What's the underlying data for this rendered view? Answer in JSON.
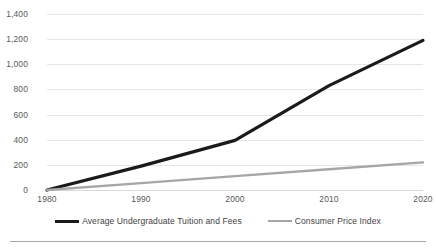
{
  "chart_data": {
    "type": "line",
    "title": "",
    "subtitle": "",
    "xlabel": "",
    "ylabel": "",
    "x": [
      1980,
      1990,
      2000,
      2010,
      2020
    ],
    "categories": [
      "1980",
      "1990",
      "2000",
      "2010",
      "2020"
    ],
    "xlim": [
      1980,
      2020
    ],
    "ylim": [
      0,
      1400
    ],
    "y_ticks": [
      0,
      200,
      400,
      600,
      800,
      1000,
      1200,
      1400
    ],
    "y_tick_labels": [
      "0",
      "200",
      "400",
      "600",
      "800",
      "1,000",
      "1,200",
      "1,400"
    ],
    "x_tick_labels": [
      "1980",
      "1990",
      "2000",
      "2010",
      "2020"
    ],
    "grid": "horizontal",
    "legend_position": "bottom",
    "series": [
      {
        "name": "Average Undergraduate Tuition and Fees",
        "color": "#1a1a1a",
        "width": 3.2,
        "values": [
          0,
          190,
          395,
          830,
          1190
        ]
      },
      {
        "name": "Consumer Price Index",
        "color": "#a6a6a6",
        "width": 2.4,
        "values": [
          0,
          55,
          110,
          165,
          220
        ]
      }
    ]
  },
  "legend": {
    "items": [
      {
        "label": "Average Undergraduate Tuition and Fees",
        "color": "#1a1a1a"
      },
      {
        "label": "Consumer Price Index",
        "color": "#a6a6a6"
      }
    ]
  },
  "colors": {
    "gridline": "#e6e6e6",
    "baseline": "#d9d9d9",
    "tick_text": "#595959",
    "legend_text": "#3f3f3f",
    "footer_rule": "#a6a6a6",
    "background": "#ffffff"
  }
}
